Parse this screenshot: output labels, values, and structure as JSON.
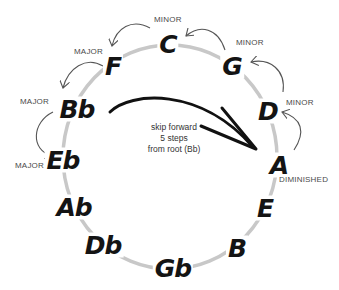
{
  "diagram": {
    "type": "circle-of-fifths",
    "ring_color": "#c8c8c8",
    "note_color": "#141414",
    "arrow_color": "#555555",
    "skip_arrow_color": "#111111",
    "notes": [
      {
        "name": "C",
        "quality": "MINOR"
      },
      {
        "name": "G",
        "quality": "MINOR"
      },
      {
        "name": "D",
        "quality": "MINOR"
      },
      {
        "name": "A",
        "quality": "DIMINISHED"
      },
      {
        "name": "E",
        "quality": ""
      },
      {
        "name": "B",
        "quality": ""
      },
      {
        "name": "Gb",
        "quality": ""
      },
      {
        "name": "Db",
        "quality": ""
      },
      {
        "name": "Ab",
        "quality": ""
      },
      {
        "name": "Eb",
        "quality": "MAJOR"
      },
      {
        "name": "Bb",
        "quality": "MAJOR"
      },
      {
        "name": "F",
        "quality": "MAJOR"
      }
    ],
    "annotation": {
      "line1": "skip forward",
      "line2": "5 steps",
      "line3": "from root (Bb)"
    }
  }
}
